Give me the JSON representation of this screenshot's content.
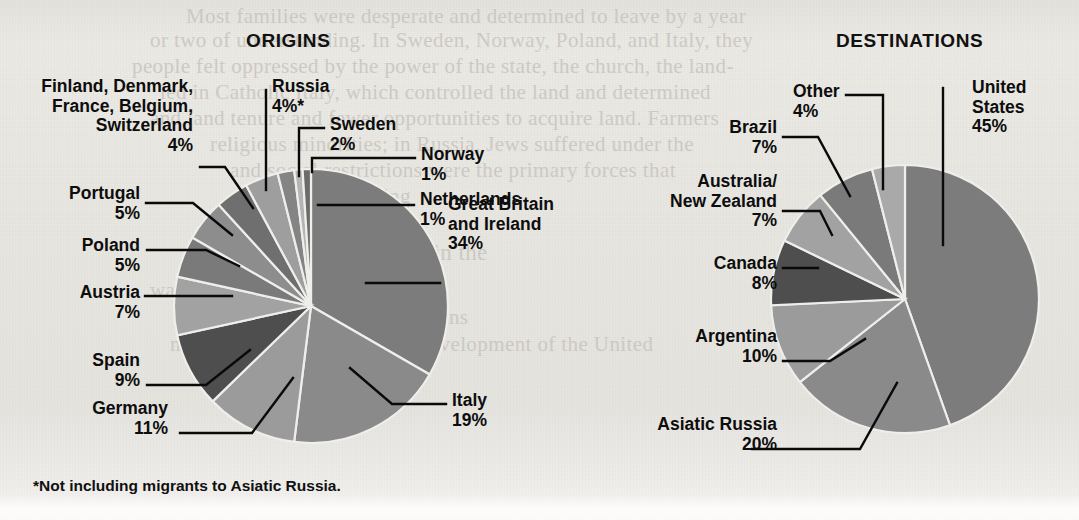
{
  "background": {
    "paper_color": "#e8e6e1",
    "ghost_text": [
      {
        "text": "Most families were desperate and determined to leave by a year",
        "x": 186,
        "y": 4,
        "size": 21
      },
      {
        "text": "or two of understanding. In Sweden, Norway, Poland, and Italy, they",
        "x": 150,
        "y": 28,
        "size": 21
      },
      {
        "text": "people felt oppressed by the power of the state, the church, the land-",
        "x": 132,
        "y": 54,
        "size": 21
      },
      {
        "text": "led in Catholic Italy, which controlled the land and determined",
        "x": 160,
        "y": 80,
        "size": 21
      },
      {
        "text": "and land tenure and fewer opportunities to acquire land. Farmers",
        "x": 150,
        "y": 106,
        "size": 21
      },
      {
        "text": "religious minorities; in Russia, Jews suffered under the",
        "x": 210,
        "y": 132,
        "size": 21
      },
      {
        "text": "and social restrictions were the primary forces that",
        "x": 230,
        "y": 158,
        "size": 21
      },
      {
        "text": "require breathing",
        "x": 260,
        "y": 184,
        "size": 21
      },
      {
        "text": "Experience in the",
        "x": 320,
        "y": 240,
        "size": 23
      },
      {
        "text": "was not a European immigrant",
        "x": 150,
        "y": 278,
        "size": 21
      },
      {
        "text": "an old nation. Europeans",
        "x": 250,
        "y": 305,
        "size": 21
      },
      {
        "text": "more work and freedom the development of the United",
        "x": 170,
        "y": 332,
        "size": 21
      },
      {
        "text": "States alike.",
        "x": 300,
        "y": 358,
        "size": 21
      }
    ]
  },
  "charts": [
    {
      "key": "origins",
      "title": "ORIGINS",
      "title_pos": {
        "x": 246,
        "y": 30
      },
      "center": {
        "x": 311,
        "y": 306
      },
      "radius": 137,
      "start_angle_deg": 0,
      "footnote": "*Not including migrants to Asiatic Russia.",
      "slices": [
        {
          "name": "Great Britain and Ireland",
          "label": "Great Britain\nand Ireland\n34%",
          "value": 34,
          "color": "#7c7c7c",
          "label_pos": {
            "x": 448,
            "y": 195
          },
          "align": "l",
          "leader": [
            [
              440,
              283
            ],
            [
              366,
              283
            ]
          ]
        },
        {
          "name": "Italy",
          "label": "Italy\n19%",
          "value": 19,
          "color": "#8a8a8a",
          "label_pos": {
            "x": 452,
            "y": 391
          },
          "align": "l",
          "leader": [
            [
              446,
              404
            ],
            [
              392,
              404
            ],
            [
              350,
              368
            ]
          ]
        },
        {
          "name": "Germany",
          "label": "Germany\n11%",
          "value": 11,
          "color": "#9b9b9b",
          "label_pos": {
            "x": 43,
            "y": 399
          },
          "align": "r",
          "label_w": 125,
          "leader": [
            [
              180,
              433
            ],
            [
              252,
              433
            ],
            [
              293,
              378
            ]
          ]
        },
        {
          "name": "Spain",
          "label": "Spain\n9%",
          "value": 9,
          "color": "#4e4e4e",
          "label_pos": {
            "x": 40,
            "y": 351
          },
          "align": "r",
          "label_w": 100,
          "leader": [
            [
              147,
              385
            ],
            [
              206,
              385
            ],
            [
              250,
              350
            ]
          ]
        },
        {
          "name": "Austria",
          "label": "Austria\n7%",
          "value": 7,
          "color": "#a2a2a2",
          "label_pos": {
            "x": 30,
            "y": 283
          },
          "align": "r",
          "label_w": 110,
          "leader": [
            [
              145,
              296
            ],
            [
              232,
              296
            ]
          ]
        },
        {
          "name": "Poland",
          "label": "Poland\n5%",
          "value": 5,
          "color": "#7a7a7a",
          "label_pos": {
            "x": 37,
            "y": 236
          },
          "align": "r",
          "label_w": 103,
          "leader": [
            [
              147,
              250
            ],
            [
              206,
              250
            ],
            [
              239,
              266
            ]
          ]
        },
        {
          "name": "Portugal",
          "label": "Portugal\n5%",
          "value": 5,
          "color": "#8d8d8d",
          "label_pos": {
            "x": 25,
            "y": 184
          },
          "align": "r",
          "label_w": 115,
          "leader": [
            [
              146,
              203
            ],
            [
              193,
              203
            ],
            [
              232,
              235
            ]
          ]
        },
        {
          "name": "Finland, Denmark, France, Belgium, Switzerland",
          "label": "Finland, Denmark,\nFrance, Belgium,\nSwitzerland\n4%",
          "value": 4,
          "color": "#6f6f6f",
          "label_pos": {
            "x": 20,
            "y": 77
          },
          "align": "r",
          "label_w": 173,
          "leader": [
            [
              200,
              167
            ],
            [
              225,
              167
            ],
            [
              253,
              208
            ]
          ]
        },
        {
          "name": "Russia",
          "label": "Russia\n4%*",
          "value": 4,
          "color": "#9e9e9e",
          "label_pos": {
            "x": 272,
            "y": 77
          },
          "align": "l",
          "leader": [
            [
              266,
              90
            ],
            [
              266,
              190
            ]
          ]
        },
        {
          "name": "Sweden",
          "label": "Sweden\n2%",
          "value": 2,
          "color": "#848484",
          "label_pos": {
            "x": 330,
            "y": 115
          },
          "align": "l",
          "leader": [
            [
              324,
              128
            ],
            [
              299,
              128
            ],
            [
              299,
              176
            ]
          ]
        },
        {
          "name": "Norway",
          "label": "Norway\n1%",
          "value": 1,
          "color": "#b4b4b4",
          "label_pos": {
            "x": 421,
            "y": 145
          },
          "align": "l",
          "leader": [
            [
              415,
              158
            ],
            [
              312,
              158
            ],
            [
              312,
              172
            ]
          ]
        },
        {
          "name": "Netherlands",
          "label": "Netherlands\n1%",
          "value": 1,
          "color": "#6b6b6b",
          "label_pos": {
            "x": 420,
            "y": 190
          },
          "align": "l",
          "leader": [
            [
              414,
              205
            ],
            [
              318,
              205
            ]
          ]
        }
      ]
    },
    {
      "key": "destinations",
      "title": "DESTINATIONS",
      "title_pos": {
        "x": 836,
        "y": 30
      },
      "center": {
        "x": 905,
        "y": 299
      },
      "radius": 134,
      "start_angle_deg": 0,
      "slices": [
        {
          "name": "United States",
          "label": "United\nStates\n45%",
          "value": 45,
          "color": "#7c7c7c",
          "label_pos": {
            "x": 972,
            "y": 78
          },
          "align": "l",
          "leader": [
            [
              943,
              88
            ],
            [
              943,
              245
            ]
          ]
        },
        {
          "name": "Asiatic Russia",
          "label": "Asiatic Russia\n20%",
          "value": 20,
          "color": "#8a8a8a",
          "label_pos": {
            "x": 612,
            "y": 415
          },
          "align": "r",
          "label_w": 165,
          "leader": [
            [
              752,
              449
            ],
            [
              860,
              449
            ],
            [
              897,
              383
            ]
          ]
        },
        {
          "name": "Argentina",
          "label": "Argentina\n10%",
          "value": 10,
          "color": "#9b9b9b",
          "label_pos": {
            "x": 628,
            "y": 327
          },
          "align": "r",
          "label_w": 149,
          "leader": [
            [
              783,
              361
            ],
            [
              830,
              361
            ],
            [
              865,
              339
            ]
          ]
        },
        {
          "name": "Canada",
          "label": "Canada\n8%",
          "value": 8,
          "color": "#4e4e4e",
          "label_pos": {
            "x": 640,
            "y": 254
          },
          "align": "r",
          "label_w": 137,
          "leader": [
            [
              783,
              268
            ],
            [
              818,
              268
            ]
          ]
        },
        {
          "name": "Australia/ New Zealand",
          "label": "Australia/\nNew Zealand\n7%",
          "value": 7,
          "color": "#a2a2a2",
          "label_pos": {
            "x": 595,
            "y": 172
          },
          "align": "r",
          "label_w": 182,
          "leader": [
            [
              783,
              211
            ],
            [
              820,
              211
            ],
            [
              832,
              235
            ]
          ]
        },
        {
          "name": "Brazil",
          "label": "Brazil\n7%",
          "value": 7,
          "color": "#7a7a7a",
          "label_pos": {
            "x": 653,
            "y": 118
          },
          "align": "r",
          "label_w": 124,
          "leader": [
            [
              783,
              137
            ],
            [
              818,
              137
            ],
            [
              850,
              196
            ]
          ]
        },
        {
          "name": "Other",
          "label": "Other\n4%",
          "value": 4,
          "color": "#a9a9a9",
          "label_pos": {
            "x": 793,
            "y": 82
          },
          "align": "l",
          "leader": [
            [
              846,
              95
            ],
            [
              883,
              95
            ],
            [
              883,
              189
            ]
          ]
        }
      ]
    }
  ]
}
